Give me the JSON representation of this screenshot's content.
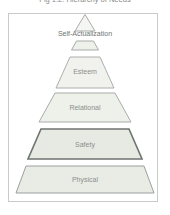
{
  "caption": "Fig 1.2: Hierarchy of Needs",
  "diagram": {
    "type": "pyramid",
    "levels": [
      {
        "label": "Self-Actualization",
        "position": 1
      },
      {
        "label": "Esteem",
        "position": 2
      },
      {
        "label": "Relational",
        "position": 3
      },
      {
        "label": "Safety",
        "position": 4
      },
      {
        "label": "Physical",
        "position": 5
      }
    ]
  },
  "colors": {
    "background": "#ffffff",
    "frame_border": "#c8cbc8",
    "level_fill": "#eef0ea",
    "level_fill_light": "#f1f2ee",
    "safety_fill": "#e7eae3",
    "physical_fill": "#e9ebe5",
    "stroke_gray": "#a8adaa",
    "stroke_dark": "#6e7370",
    "label_text": "#8b8f8d",
    "caption_text": "#8a8a8a"
  }
}
